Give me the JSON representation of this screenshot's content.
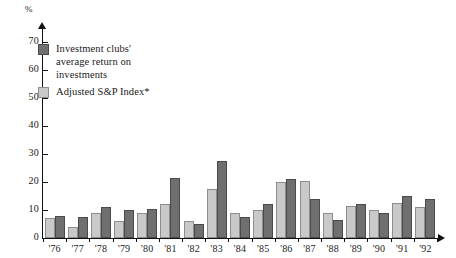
{
  "chart_data": {
    "type": "bar",
    "title": "",
    "xlabel": "",
    "ylabel": "%",
    "ylim": [
      0,
      75
    ],
    "yticks": [
      0,
      10,
      20,
      30,
      40,
      50,
      60,
      70
    ],
    "grid": false,
    "legend_position": "upper-left",
    "categories": [
      "'76",
      "'77",
      "'78",
      "'79",
      "'80",
      "'81",
      "'82",
      "'83",
      "'84",
      "'85",
      "'86",
      "'87",
      "'88",
      "'89",
      "'90",
      "'91",
      "'92"
    ],
    "series": [
      {
        "name": "Adjusted S&P Index*",
        "color": "#c9c9c9",
        "values": [
          7,
          4,
          9,
          6,
          9,
          12,
          6,
          17.5,
          9,
          10,
          20,
          20.5,
          9,
          11.5,
          10,
          12.5,
          11
        ]
      },
      {
        "name": "Investment clubs' average return on investments",
        "color": "#6f6f6f",
        "values": [
          8,
          7.5,
          11,
          10,
          10.5,
          21.5,
          5,
          27.5,
          7.5,
          12,
          21,
          14,
          6.5,
          12,
          9,
          15,
          14
        ]
      }
    ],
    "annotations": []
  },
  "axis": {
    "unit_label": "%",
    "y_tick_labels": [
      "70",
      "60",
      "50",
      "40",
      "30",
      "20",
      "10",
      "0"
    ],
    "x_tick_labels": [
      "'76",
      "'77",
      "'78",
      "'79",
      "'80",
      "'81",
      "'82",
      "'83",
      "'84",
      "'85",
      "'86",
      "'87",
      "'88",
      "'89",
      "'90",
      "'91",
      "'92"
    ]
  },
  "legend": {
    "items": [
      {
        "swatch": "dark",
        "label": "Investment clubs'\naverage return on\ninvestments"
      },
      {
        "swatch": "light",
        "label": "Adjusted S&P Index*"
      }
    ]
  }
}
